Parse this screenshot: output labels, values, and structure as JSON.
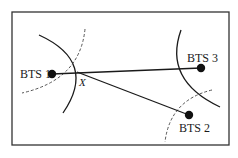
{
  "diagram": {
    "type": "cell-tower-trilateration",
    "nodes": [
      {
        "id": "bts1",
        "label": "BTS 1",
        "x": 52,
        "y": 74
      },
      {
        "id": "bts2",
        "label": "BTS 2",
        "x": 189,
        "y": 115
      },
      {
        "id": "bts3",
        "label": "BTS 3",
        "x": 201,
        "y": 68
      }
    ],
    "intersection": {
      "label": "X",
      "x": 77,
      "y": 72
    },
    "edges": [
      {
        "from": "bts1",
        "to": "bts3"
      },
      {
        "from": "intersection",
        "to": "bts2"
      }
    ],
    "colors": {
      "stroke": "#1a1a1a",
      "frame": "#333333",
      "background": "#ffffff"
    }
  }
}
